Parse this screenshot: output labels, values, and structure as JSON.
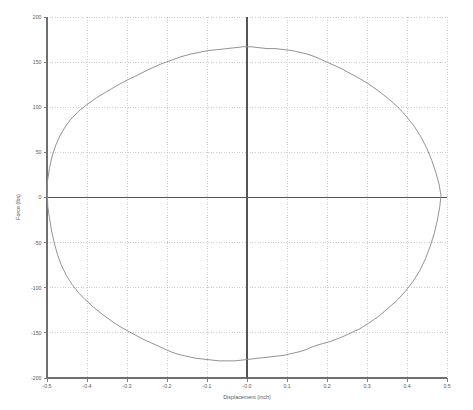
{
  "chart_data": {
    "type": "line",
    "title": "",
    "subtitle": "",
    "xlabel": "Displacement (inch)",
    "ylabel": "Force (lbs)",
    "xlim": [
      -0.5,
      0.5
    ],
    "ylim": [
      -200,
      200
    ],
    "xticks": [
      -0.5,
      -0.4,
      -0.3,
      -0.2,
      -0.1,
      0.0,
      0.1,
      0.2,
      0.3,
      0.4,
      0.5
    ],
    "xticklabels": [
      "-0.5",
      "-0.4",
      "-0.3",
      "-0.2",
      "-0.1",
      "-0.0",
      "0.1",
      "0.2",
      "0.3",
      "0.4",
      "0.5"
    ],
    "yticks": [
      -200,
      -150,
      -100,
      -50,
      0,
      50,
      100,
      150,
      200
    ],
    "yticklabels": [
      "-200",
      "-150",
      "-100",
      "-50",
      "0",
      "50",
      "100",
      "150",
      "200"
    ],
    "grid": true,
    "legend": null,
    "legend_position": "none",
    "curve_color": "#8d8d8d",
    "grid_color": "#b9b9b9",
    "axis_color": "#6f6f6f",
    "background_color": "#ffffff",
    "series": [
      {
        "name": "hysteresis-loop",
        "closed": true,
        "upper_branch": [
          [
            -0.5,
            15
          ],
          [
            -0.494,
            32
          ],
          [
            -0.487,
            46
          ],
          [
            -0.478,
            58
          ],
          [
            -0.468,
            68
          ],
          [
            -0.455,
            78
          ],
          [
            -0.44,
            87
          ],
          [
            -0.42,
            96
          ],
          [
            -0.4,
            103
          ],
          [
            -0.378,
            110
          ],
          [
            -0.352,
            117
          ],
          [
            -0.325,
            124
          ],
          [
            -0.3,
            130
          ],
          [
            -0.272,
            136
          ],
          [
            -0.245,
            142
          ],
          [
            -0.215,
            148
          ],
          [
            -0.19,
            152
          ],
          [
            -0.165,
            156
          ],
          [
            -0.14,
            159
          ],
          [
            -0.118,
            161
          ],
          [
            -0.095,
            163
          ],
          [
            -0.07,
            164
          ],
          [
            -0.05,
            165
          ],
          [
            -0.03,
            166
          ],
          [
            -0.01,
            167
          ],
          [
            0.01,
            167
          ],
          [
            0.03,
            166
          ],
          [
            0.05,
            165
          ],
          [
            0.07,
            165
          ],
          [
            0.09,
            164
          ],
          [
            0.11,
            163
          ],
          [
            0.13,
            161
          ],
          [
            0.15,
            159
          ],
          [
            0.17,
            156
          ],
          [
            0.19,
            152
          ],
          [
            0.21,
            148
          ],
          [
            0.235,
            143
          ],
          [
            0.26,
            137
          ],
          [
            0.285,
            131
          ],
          [
            0.31,
            124
          ],
          [
            0.335,
            116
          ],
          [
            0.36,
            107
          ],
          [
            0.38,
            99
          ],
          [
            0.4,
            89
          ],
          [
            0.418,
            79
          ],
          [
            0.435,
            67
          ],
          [
            0.45,
            54
          ],
          [
            0.462,
            41
          ],
          [
            0.472,
            28
          ],
          [
            0.48,
            15
          ],
          [
            0.485,
            2
          ]
        ],
        "lower_branch": [
          [
            0.485,
            2
          ],
          [
            0.482,
            -10
          ],
          [
            0.476,
            -25
          ],
          [
            0.468,
            -40
          ],
          [
            0.458,
            -54
          ],
          [
            0.446,
            -68
          ],
          [
            0.432,
            -81
          ],
          [
            0.415,
            -93
          ],
          [
            0.396,
            -104
          ],
          [
            0.375,
            -114
          ],
          [
            0.352,
            -123
          ],
          [
            0.328,
            -132
          ],
          [
            0.305,
            -139
          ],
          [
            0.28,
            -146
          ],
          [
            0.255,
            -151
          ],
          [
            0.23,
            -156
          ],
          [
            0.205,
            -160
          ],
          [
            0.18,
            -163
          ],
          [
            0.16,
            -166
          ],
          [
            0.145,
            -169
          ],
          [
            0.13,
            -171
          ],
          [
            0.11,
            -173
          ],
          [
            0.09,
            -175
          ],
          [
            0.07,
            -176
          ],
          [
            0.05,
            -177
          ],
          [
            0.03,
            -178
          ],
          [
            0.01,
            -179
          ],
          [
            -0.01,
            -180
          ],
          [
            -0.03,
            -181
          ],
          [
            -0.05,
            -181
          ],
          [
            -0.07,
            -181
          ],
          [
            -0.09,
            -180
          ],
          [
            -0.11,
            -179
          ],
          [
            -0.13,
            -178
          ],
          [
            -0.15,
            -176
          ],
          [
            -0.17,
            -174
          ],
          [
            -0.19,
            -171
          ],
          [
            -0.21,
            -167
          ],
          [
            -0.235,
            -162
          ],
          [
            -0.26,
            -157
          ],
          [
            -0.285,
            -151
          ],
          [
            -0.31,
            -145
          ],
          [
            -0.335,
            -138
          ],
          [
            -0.36,
            -130
          ],
          [
            -0.385,
            -121
          ],
          [
            -0.405,
            -113
          ],
          [
            -0.422,
            -105
          ],
          [
            -0.438,
            -96
          ],
          [
            -0.452,
            -86
          ],
          [
            -0.464,
            -75
          ],
          [
            -0.474,
            -63
          ],
          [
            -0.482,
            -50
          ],
          [
            -0.489,
            -36
          ],
          [
            -0.494,
            -22
          ],
          [
            -0.498,
            -10
          ],
          [
            -0.5,
            15
          ]
        ],
        "peak_force": 167,
        "min_force": -181,
        "max_displacement": 0.485,
        "min_displacement": -0.5
      }
    ]
  },
  "figure": {
    "background_color": "#ffffff",
    "width": 473,
    "height": 410
  }
}
